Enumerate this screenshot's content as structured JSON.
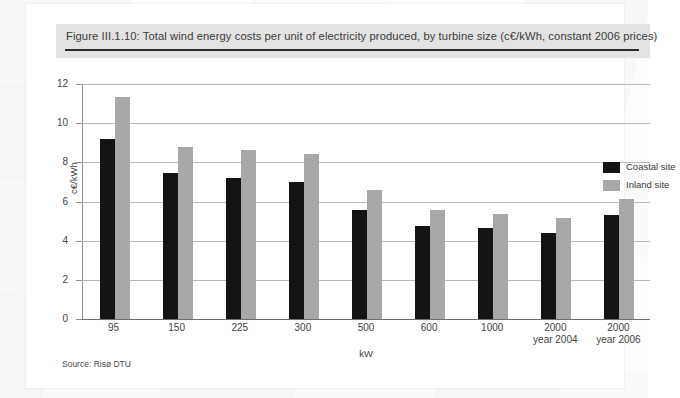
{
  "figure": {
    "title": "Figure III.1.10: Total wind energy costs per unit of electricity produced, by turbine size (c€/kWh, constant 2006 prices)",
    "source": "Source: Risø DTU"
  },
  "legend": {
    "position": "top-right",
    "items": [
      {
        "label": "Coastal site",
        "color": "#141414",
        "name": "coastal"
      },
      {
        "label": "Inland site",
        "color": "#a8a8a8",
        "name": "inland"
      }
    ]
  },
  "axes": {
    "y_ticks": [
      "0",
      "2",
      "4",
      "6",
      "8",
      "10",
      "12"
    ],
    "y_title": "c€/kWh",
    "x_title": "kW"
  },
  "chart_data": {
    "type": "bar",
    "title": "Figure III.1.10: Total wind energy costs per unit of electricity produced, by turbine size (c€/kWh, constant 2006 prices)",
    "xlabel": "kW",
    "ylabel": "c€/kWh",
    "ylim": [
      0,
      12
    ],
    "ytick_step": 2,
    "grid": true,
    "legend_position": "top-right",
    "categories": [
      "95",
      "150",
      "225",
      "300",
      "500",
      "600",
      "1000",
      "2000\nyear 2004",
      "2000\nyear 2006"
    ],
    "category_lines": [
      [
        "95"
      ],
      [
        "150"
      ],
      [
        "225"
      ],
      [
        "300"
      ],
      [
        "500"
      ],
      [
        "600"
      ],
      [
        "1000"
      ],
      [
        "2000",
        "year 2004"
      ],
      [
        "2000",
        "year 2006"
      ]
    ],
    "series": [
      {
        "name": "Coastal site",
        "color": "#141414",
        "values": [
          9.2,
          7.45,
          7.2,
          7.0,
          5.55,
          4.75,
          4.65,
          4.4,
          5.3
        ]
      },
      {
        "name": "Inland site",
        "color": "#a8a8a8",
        "values": [
          11.35,
          8.8,
          8.65,
          8.45,
          6.6,
          5.55,
          5.35,
          5.15,
          6.15
        ]
      }
    ]
  }
}
